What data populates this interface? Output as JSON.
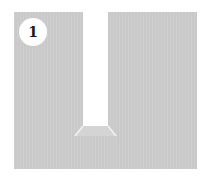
{
  "diagram": {
    "step_badge": {
      "label": "1"
    },
    "colors": {
      "panel": "#c9c9c9",
      "slot": "#ffffff",
      "bevel_face": "#d4d4d4",
      "bevel_edge": "#f4f4f4",
      "badge_bg": "#ffffff",
      "badge_text": "#1a1a1a"
    }
  }
}
